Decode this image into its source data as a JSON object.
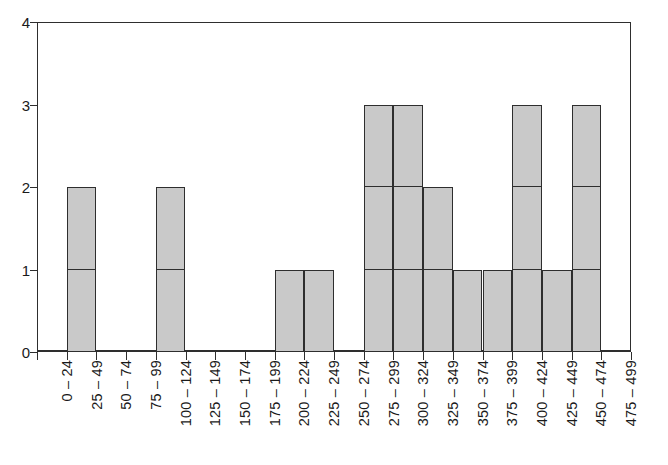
{
  "chart_data": {
    "type": "bar",
    "title": "",
    "subtitle": "",
    "xlabel": "",
    "ylabel": "",
    "categories": [
      "0 – 24",
      "25 – 49",
      "50 – 74",
      "75 – 99",
      "100 – 124",
      "125 – 149",
      "150 – 174",
      "175 – 199",
      "200 – 224",
      "225 – 249",
      "250 – 274",
      "275 – 299",
      "300 – 324",
      "325 – 349",
      "350 – 374",
      "375 – 399",
      "400 – 424",
      "425 – 449",
      "450 – 474",
      "475 – 499"
    ],
    "values": [
      0,
      2,
      0,
      0,
      2,
      0,
      0,
      0,
      1,
      1,
      0,
      3,
      3,
      2,
      1,
      1,
      3,
      1,
      3,
      0
    ],
    "ylim": [
      0,
      4
    ],
    "ytick_labels": [
      "0",
      "1",
      "2",
      "3",
      "4"
    ],
    "ytick_values": [
      0,
      1,
      2,
      3,
      4
    ],
    "grid": false,
    "legend": null,
    "bar_fill_color": "#c9c9c9",
    "bar_edge_color": "#2e2e2e",
    "axis_color": "#2e2e2e",
    "background_color": "#ffffff",
    "bar_gap": 0,
    "segmented_unit_blocks": true,
    "xtick_label_rotation": 90
  }
}
